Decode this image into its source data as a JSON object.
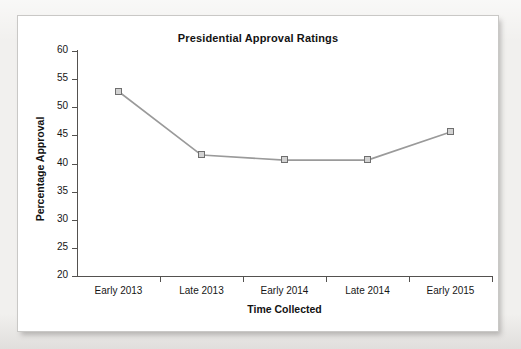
{
  "figure": {
    "title": "Presidential Approval Ratings"
  },
  "chart_data": {
    "type": "line",
    "title": "Presidential Approval Ratings",
    "xlabel": "Time Collected",
    "ylabel": "Percentage Approval",
    "categories": [
      "Early 2013",
      "Late 2013",
      "Early 2014",
      "Late 2014",
      "Early 2015"
    ],
    "values": [
      52.8,
      41.5,
      40.6,
      40.6,
      45.6
    ],
    "series": [
      {
        "name": "Percentage Approval",
        "values": [
          52.8,
          41.5,
          40.6,
          40.6,
          45.6
        ]
      }
    ],
    "ylim": [
      20,
      60
    ],
    "ytick_step": 5,
    "yticks": [
      60,
      55,
      50,
      45,
      40,
      35,
      30,
      25,
      20
    ],
    "ytick_labels": [
      "60",
      "55",
      "50",
      "45",
      "40",
      "35",
      "30",
      "25",
      "20"
    ],
    "grid": false,
    "legend": false,
    "legend_position": "none",
    "marker": "square",
    "colors": {
      "line": "#9a9a9a",
      "marker_fill": "#d2d2d2",
      "marker_edge": "#6f6f6f",
      "axis": "#53514f",
      "text": "#161616",
      "panel_background": "#ffffff",
      "page_background": "#f1f0ee"
    }
  }
}
